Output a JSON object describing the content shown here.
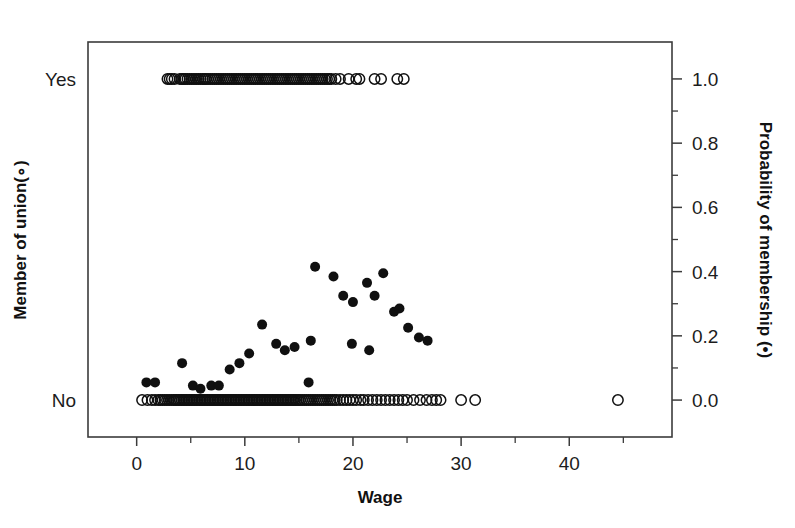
{
  "chart_data": {
    "type": "scatter",
    "title": "",
    "subtitle": "",
    "xlabel": "Wage",
    "ylabel_left": "Member of union(∘)",
    "ylabel_right": "Probability of membership (•)",
    "grid": false,
    "legend_position": "none",
    "xlim": [
      -4.5,
      49.5
    ],
    "xticks": [
      0,
      5,
      10,
      15,
      20,
      25,
      30,
      35,
      40,
      45
    ],
    "xtick_labels_shown": [
      "0",
      "10",
      "20",
      "30",
      "40"
    ],
    "xtick_label_values": [
      0,
      10,
      20,
      30,
      40
    ],
    "ylim_right": [
      -0.115,
      1.115
    ],
    "yticks_right": [
      0.0,
      0.1,
      0.2,
      0.3,
      0.4,
      0.5,
      0.6,
      0.7,
      0.8,
      0.9,
      1.0
    ],
    "ytick_labels_right_shown": [
      "0.0",
      "0.2",
      "0.4",
      "0.6",
      "0.8",
      "1.0"
    ],
    "ytick_label_right_values": [
      0.0,
      0.2,
      0.4,
      0.6,
      0.8,
      1.0
    ],
    "ycat_labels_left": [
      "No",
      "Yes"
    ],
    "ycat_left_values": [
      0.0,
      1.0
    ],
    "series": [
      {
        "name": "Member of union (observed)",
        "marker": "open-circle",
        "marker_size": 5.2,
        "color": "#101010",
        "note": "Binary outcome plotted at 0 (No) or 1 (Yes) against wage; heavy overplotting.",
        "points": [
          [
            2.85,
            1
          ],
          [
            3.05,
            1
          ],
          [
            3.25,
            1
          ],
          [
            3.5,
            1
          ],
          [
            4.0,
            1
          ],
          [
            4.2,
            1
          ],
          [
            4.35,
            1
          ],
          [
            4.5,
            1
          ],
          [
            4.7,
            1
          ],
          [
            4.9,
            1
          ],
          [
            5.1,
            1
          ],
          [
            5.3,
            1
          ],
          [
            5.5,
            1
          ],
          [
            5.7,
            1
          ],
          [
            5.9,
            1
          ],
          [
            6.1,
            1
          ],
          [
            6.25,
            1
          ],
          [
            6.4,
            1
          ],
          [
            6.6,
            1
          ],
          [
            6.8,
            1
          ],
          [
            7.0,
            1
          ],
          [
            7.2,
            1
          ],
          [
            7.4,
            1
          ],
          [
            7.6,
            1
          ],
          [
            7.8,
            1
          ],
          [
            8.0,
            1
          ],
          [
            8.2,
            1
          ],
          [
            8.4,
            1
          ],
          [
            8.6,
            1
          ],
          [
            8.8,
            1
          ],
          [
            9.0,
            1
          ],
          [
            9.2,
            1
          ],
          [
            9.4,
            1
          ],
          [
            9.6,
            1
          ],
          [
            9.8,
            1
          ],
          [
            10.0,
            1
          ],
          [
            10.2,
            1
          ],
          [
            10.4,
            1
          ],
          [
            10.6,
            1
          ],
          [
            10.8,
            1
          ],
          [
            11.0,
            1
          ],
          [
            11.2,
            1
          ],
          [
            11.4,
            1
          ],
          [
            11.6,
            1
          ],
          [
            11.8,
            1
          ],
          [
            12.0,
            1
          ],
          [
            12.2,
            1
          ],
          [
            12.4,
            1
          ],
          [
            12.6,
            1
          ],
          [
            12.8,
            1
          ],
          [
            13.0,
            1
          ],
          [
            13.2,
            1
          ],
          [
            13.4,
            1
          ],
          [
            13.6,
            1
          ],
          [
            13.8,
            1
          ],
          [
            14.0,
            1
          ],
          [
            14.2,
            1
          ],
          [
            14.4,
            1
          ],
          [
            14.6,
            1
          ],
          [
            14.8,
            1
          ],
          [
            15.0,
            1
          ],
          [
            15.2,
            1
          ],
          [
            15.4,
            1
          ],
          [
            15.6,
            1
          ],
          [
            15.8,
            1
          ],
          [
            16.0,
            1
          ],
          [
            16.2,
            1
          ],
          [
            16.4,
            1
          ],
          [
            16.6,
            1
          ],
          [
            16.8,
            1
          ],
          [
            17.0,
            1
          ],
          [
            17.2,
            1
          ],
          [
            17.4,
            1
          ],
          [
            17.6,
            1
          ],
          [
            17.8,
            1
          ],
          [
            18.0,
            1
          ],
          [
            18.4,
            1
          ],
          [
            18.8,
            1
          ],
          [
            19.6,
            1
          ],
          [
            20.3,
            1
          ],
          [
            20.6,
            1
          ],
          [
            22.0,
            1
          ],
          [
            22.6,
            1
          ],
          [
            24.1,
            1
          ],
          [
            24.7,
            1
          ],
          [
            0.5,
            0
          ],
          [
            1.0,
            0
          ],
          [
            1.4,
            0
          ],
          [
            1.7,
            0
          ],
          [
            2.0,
            0
          ],
          [
            2.2,
            0
          ],
          [
            2.4,
            0
          ],
          [
            2.6,
            0
          ],
          [
            2.8,
            0
          ],
          [
            3.0,
            0
          ],
          [
            3.2,
            0
          ],
          [
            3.4,
            0
          ],
          [
            3.55,
            0
          ],
          [
            3.7,
            0
          ],
          [
            3.85,
            0
          ],
          [
            4.0,
            0
          ],
          [
            4.15,
            0
          ],
          [
            4.3,
            0
          ],
          [
            4.45,
            0
          ],
          [
            4.6,
            0
          ],
          [
            4.75,
            0
          ],
          [
            4.9,
            0
          ],
          [
            5.05,
            0
          ],
          [
            5.2,
            0
          ],
          [
            5.35,
            0
          ],
          [
            5.5,
            0
          ],
          [
            5.65,
            0
          ],
          [
            5.8,
            0
          ],
          [
            5.95,
            0
          ],
          [
            6.1,
            0
          ],
          [
            6.25,
            0
          ],
          [
            6.4,
            0
          ],
          [
            6.55,
            0
          ],
          [
            6.7,
            0
          ],
          [
            6.85,
            0
          ],
          [
            7.0,
            0
          ],
          [
            7.15,
            0
          ],
          [
            7.3,
            0
          ],
          [
            7.45,
            0
          ],
          [
            7.6,
            0
          ],
          [
            7.75,
            0
          ],
          [
            7.9,
            0
          ],
          [
            8.05,
            0
          ],
          [
            8.2,
            0
          ],
          [
            8.35,
            0
          ],
          [
            8.5,
            0
          ],
          [
            8.65,
            0
          ],
          [
            8.8,
            0
          ],
          [
            8.95,
            0
          ],
          [
            9.1,
            0
          ],
          [
            9.25,
            0
          ],
          [
            9.4,
            0
          ],
          [
            9.55,
            0
          ],
          [
            9.7,
            0
          ],
          [
            9.85,
            0
          ],
          [
            10.0,
            0
          ],
          [
            10.15,
            0
          ],
          [
            10.3,
            0
          ],
          [
            10.45,
            0
          ],
          [
            10.6,
            0
          ],
          [
            10.75,
            0
          ],
          [
            10.9,
            0
          ],
          [
            11.05,
            0
          ],
          [
            11.2,
            0
          ],
          [
            11.35,
            0
          ],
          [
            11.5,
            0
          ],
          [
            11.65,
            0
          ],
          [
            11.8,
            0
          ],
          [
            11.95,
            0
          ],
          [
            12.1,
            0
          ],
          [
            12.25,
            0
          ],
          [
            12.4,
            0
          ],
          [
            12.55,
            0
          ],
          [
            12.7,
            0
          ],
          [
            12.85,
            0
          ],
          [
            13.0,
            0
          ],
          [
            13.15,
            0
          ],
          [
            13.3,
            0
          ],
          [
            13.45,
            0
          ],
          [
            13.6,
            0
          ],
          [
            13.75,
            0
          ],
          [
            13.9,
            0
          ],
          [
            14.05,
            0
          ],
          [
            14.2,
            0
          ],
          [
            14.35,
            0
          ],
          [
            14.5,
            0
          ],
          [
            14.65,
            0
          ],
          [
            14.8,
            0
          ],
          [
            14.95,
            0
          ],
          [
            15.1,
            0
          ],
          [
            15.3,
            0
          ],
          [
            15.5,
            0
          ],
          [
            15.7,
            0
          ],
          [
            15.9,
            0
          ],
          [
            16.1,
            0
          ],
          [
            16.3,
            0
          ],
          [
            16.5,
            0
          ],
          [
            16.7,
            0
          ],
          [
            16.9,
            0
          ],
          [
            17.1,
            0
          ],
          [
            17.3,
            0
          ],
          [
            17.5,
            0
          ],
          [
            17.7,
            0
          ],
          [
            17.9,
            0
          ],
          [
            18.1,
            0
          ],
          [
            18.3,
            0
          ],
          [
            18.5,
            0
          ],
          [
            18.8,
            0
          ],
          [
            19.1,
            0
          ],
          [
            19.4,
            0
          ],
          [
            19.7,
            0
          ],
          [
            20.0,
            0
          ],
          [
            20.3,
            0
          ],
          [
            20.7,
            0
          ],
          [
            21.0,
            0
          ],
          [
            21.4,
            0
          ],
          [
            21.8,
            0
          ],
          [
            22.2,
            0
          ],
          [
            22.6,
            0
          ],
          [
            23.0,
            0
          ],
          [
            23.4,
            0
          ],
          [
            23.8,
            0
          ],
          [
            24.2,
            0
          ],
          [
            24.6,
            0
          ],
          [
            25.0,
            0
          ],
          [
            25.6,
            0
          ],
          [
            26.2,
            0
          ],
          [
            26.8,
            0
          ],
          [
            27.3,
            0
          ],
          [
            27.7,
            0
          ],
          [
            28.1,
            0
          ],
          [
            30.0,
            0
          ],
          [
            31.3,
            0
          ],
          [
            44.5,
            0
          ]
        ]
      },
      {
        "name": "Probability of membership (fitted)",
        "marker": "filled-circle",
        "marker_size": 5.0,
        "color": "#101010",
        "note": "Fitted probability of union membership versus wage.",
        "points": [
          [
            0.9,
            0.055
          ],
          [
            1.7,
            0.055
          ],
          [
            4.2,
            0.115
          ],
          [
            5.2,
            0.045
          ],
          [
            5.9,
            0.035
          ],
          [
            6.9,
            0.045
          ],
          [
            7.6,
            0.045
          ],
          [
            8.6,
            0.095
          ],
          [
            9.5,
            0.115
          ],
          [
            10.4,
            0.145
          ],
          [
            11.6,
            0.235
          ],
          [
            12.9,
            0.175
          ],
          [
            13.7,
            0.155
          ],
          [
            14.6,
            0.165
          ],
          [
            15.9,
            0.055
          ],
          [
            16.1,
            0.185
          ],
          [
            16.5,
            0.415
          ],
          [
            18.2,
            0.385
          ],
          [
            19.1,
            0.325
          ],
          [
            19.9,
            0.175
          ],
          [
            20.0,
            0.305
          ],
          [
            21.3,
            0.365
          ],
          [
            21.5,
            0.155
          ],
          [
            22.0,
            0.325
          ],
          [
            22.8,
            0.395
          ],
          [
            23.8,
            0.275
          ],
          [
            24.3,
            0.285
          ],
          [
            25.1,
            0.225
          ],
          [
            26.1,
            0.195
          ],
          [
            26.9,
            0.185
          ]
        ]
      }
    ]
  },
  "axes": {
    "left_axis_name": "member-of-union",
    "right_axis_name": "probability-of-membership",
    "bottom_axis_name": "wage"
  }
}
